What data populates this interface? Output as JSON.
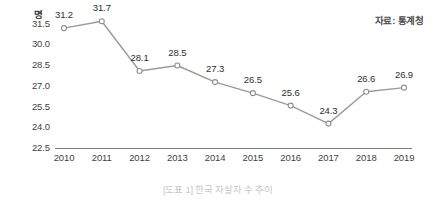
{
  "figure": {
    "unit_label": "명",
    "source_note": "자료: 통계청",
    "caption": "[도표 1] 한국 자살자 수 추이"
  },
  "chart_data": {
    "type": "line",
    "title": "[도표 1] 한국 자살자 수 추이",
    "subtitle": "",
    "xlabel": "",
    "ylabel": "명",
    "source": "자료: 통계청",
    "categories": [
      "2010",
      "2011",
      "2012",
      "2013",
      "2014",
      "2015",
      "2016",
      "2017",
      "2018",
      "2019"
    ],
    "values": [
      31.2,
      31.7,
      28.1,
      28.5,
      27.3,
      26.5,
      25.6,
      24.3,
      26.6,
      26.9
    ],
    "point_labels": [
      "31.2",
      "31.7",
      "28.1",
      "28.5",
      "27.3",
      "26.5",
      "25.6",
      "24.3",
      "26.6",
      "26.9"
    ],
    "ylim": [
      22.5,
      31.5
    ],
    "yticks": [
      31.5,
      30.0,
      28.5,
      27.0,
      25.5,
      24.0,
      22.5
    ],
    "ytick_labels": [
      "31.5",
      "30.0",
      "28.5",
      "27.0",
      "25.5",
      "24.0",
      "22.5"
    ],
    "grid": false,
    "legend": "none",
    "series": [
      {
        "name": "한국 자살자 수",
        "values": [
          31.2,
          31.7,
          28.1,
          28.5,
          27.3,
          26.5,
          25.6,
          24.3,
          26.6,
          26.9
        ],
        "line_color": "#9a9a9a",
        "marker": "open-circle",
        "marker_fill": "#ffffff",
        "marker_edge_color": "#8f8f8f"
      }
    ],
    "colors": {
      "line": "#9a9a9a",
      "axis": "#7d7d7d",
      "tick_text": "#3f3f3f",
      "data_label": "#2e2e2e",
      "caption": "#c8c8c8",
      "background": "#ffffff"
    }
  }
}
